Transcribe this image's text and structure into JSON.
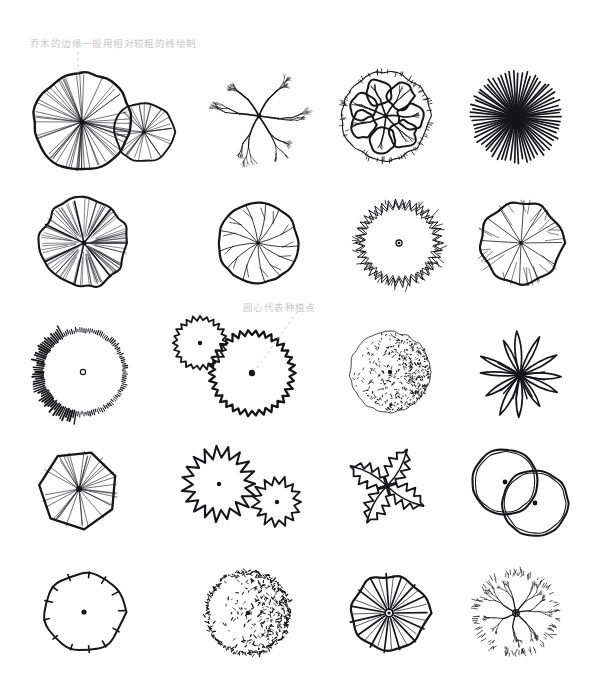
{
  "page": {
    "background_color": "#ffffff",
    "ink_color": "#16161a",
    "annotation_color": "#c9c9c9",
    "width": 610,
    "height": 699,
    "grid": {
      "columns": 4,
      "rows": 5
    }
  },
  "annotations": [
    {
      "id": "annot-1",
      "text": "乔木的边缘一般用相对较粗的线绘制",
      "leader": "dashed-vertical",
      "points_to": "tree-r1c1",
      "x": 30,
      "y": 36
    },
    {
      "id": "annot-2",
      "text": "圆心代表种植点",
      "leader": "dashed-diagonal",
      "points_to": "tree-r3c2",
      "x": 243,
      "y": 300
    }
  ],
  "symbols": [
    {
      "row": 1,
      "col": 1,
      "id": "tree-r1c1",
      "name": "radial-spoke-double-canopy",
      "label": "辐射线双冠乔木",
      "center_dot": false,
      "cx": 82,
      "cy": 122,
      "r": 49
    },
    {
      "row": 1,
      "col": 2,
      "id": "tree-r1c2",
      "name": "branching-dendritic-canopy",
      "label": "分枝型树冠",
      "center_dot": false,
      "cx": 259,
      "cy": 116,
      "r": 44
    },
    {
      "row": 1,
      "col": 3,
      "id": "tree-r1c3",
      "name": "cloud-lobed-branch-canopy",
      "label": "云朵分枝树冠",
      "center_dot": false,
      "cx": 386,
      "cy": 116,
      "r": 44
    },
    {
      "row": 1,
      "col": 4,
      "id": "tree-r1c4",
      "name": "dense-starburst-canopy",
      "label": "密集放射状树冠",
      "center_dot": false,
      "cx": 516,
      "cy": 117,
      "r": 47
    },
    {
      "row": 2,
      "col": 1,
      "id": "tree-r2c1",
      "name": "fan-fold-lobed-canopy",
      "label": "折扇裂叶树冠",
      "center_dot": false,
      "cx": 84,
      "cy": 243,
      "r": 44
    },
    {
      "row": 2,
      "col": 2,
      "id": "tree-r2c2",
      "name": "circle-with-veins-canopy",
      "label": "圆形叶脉树冠",
      "center_dot": false,
      "cx": 258,
      "cy": 243,
      "r": 40
    },
    {
      "row": 2,
      "col": 3,
      "id": "tree-r2c3",
      "name": "zigzag-ring-canopy",
      "label": "锄齿环状树冠",
      "center_dot": true,
      "cx": 399,
      "cy": 243,
      "r": 44
    },
    {
      "row": 2,
      "col": 4,
      "id": "tree-r2c4",
      "name": "scalloped-radial-canopy",
      "label": "波状边缘树冠",
      "center_dot": false,
      "cx": 521,
      "cy": 243,
      "r": 44
    },
    {
      "row": 3,
      "col": 1,
      "id": "tree-r3c1",
      "name": "hatched-rim-circle",
      "label": "短线影线圆形",
      "center_dot": true,
      "cx": 83,
      "cy": 372,
      "r": 40
    },
    {
      "row": 3,
      "col": 2,
      "id": "tree-r3c2",
      "name": "zigzag-edge-double-canopy",
      "label": "锄齿边双冠乔木",
      "center_dot": true,
      "cx": 252,
      "cy": 373,
      "r": 43
    },
    {
      "row": 3,
      "col": 3,
      "id": "tree-r3c3",
      "name": "stipple-shaded-circle",
      "label": "点状质感圆形",
      "center_dot": true,
      "cx": 390,
      "cy": 372,
      "r": 40
    },
    {
      "row": 3,
      "col": 4,
      "id": "tree-r3c4",
      "name": "palm-frond-rosette",
      "label": "棕榈叶片形",
      "center_dot": false,
      "cx": 520,
      "cy": 375,
      "r": 45
    },
    {
      "row": 4,
      "col": 1,
      "id": "tree-r4c1",
      "name": "hexagon-radial-canopy",
      "label": "六边形辐射树冠",
      "center_dot": true,
      "cx": 79,
      "cy": 489,
      "r": 40
    },
    {
      "row": 4,
      "col": 2,
      "id": "tree-r4c2",
      "name": "spiky-star-double-canopy",
      "label": "尖刺星形双冠",
      "center_dot": true,
      "cx": 229,
      "cy": 488,
      "r": 37
    },
    {
      "row": 4,
      "col": 3,
      "id": "tree-r4c3",
      "name": "spiky-pinwheel-fern",
      "label": "尖刺风车形",
      "center_dot": false,
      "cx": 387,
      "cy": 486,
      "r": 45
    },
    {
      "row": 4,
      "col": 4,
      "id": "tree-r4c4",
      "name": "overlapping-plain-circles",
      "label": "双圆重叠树冠",
      "center_dot": true,
      "cx": 518,
      "cy": 490,
      "r": 33
    },
    {
      "row": 5,
      "col": 1,
      "id": "tree-r5c1",
      "name": "scalloped-circle-with-ticks",
      "label": "波状圆形内刻线",
      "center_dot": true,
      "cx": 84,
      "cy": 612,
      "r": 42
    },
    {
      "row": 5,
      "col": 2,
      "id": "tree-r5c2",
      "name": "fuzzy-shaded-circle",
      "label": "毛状影线圆形",
      "center_dot": true,
      "cx": 248,
      "cy": 613,
      "r": 42
    },
    {
      "row": 5,
      "col": 3,
      "id": "tree-r5c3",
      "name": "radial-petal-canopy",
      "label": "辐射花瓣树冠",
      "center_dot": true,
      "cx": 389,
      "cy": 613,
      "r": 41
    },
    {
      "row": 5,
      "col": 4,
      "id": "tree-r5c4",
      "name": "fine-branch-shrub",
      "label": "细枝灌木",
      "center_dot": true,
      "cx": 516,
      "cy": 613,
      "r": 41
    }
  ]
}
